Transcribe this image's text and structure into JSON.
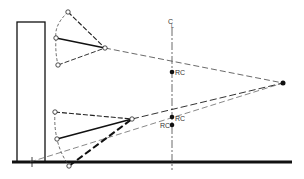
{
  "diagram": {
    "type": "geometric line diagram",
    "labels": {
      "centerline": "C",
      "centerline_sub": "L",
      "rc_upper": "RC",
      "rc_lower_right": "RC",
      "rc_lower_left": "RC"
    },
    "colors": {
      "line": "#111111",
      "dashed": "#444444",
      "background": "#ffffff"
    },
    "elements": {
      "wall_rect": {
        "x": 17,
        "y": 22,
        "w": 28,
        "h": 140
      },
      "ground_line": {
        "x1": 12,
        "y1": 162,
        "x2": 292,
        "y2": 162
      },
      "centerline_x": 172,
      "focal_point": {
        "x": 283,
        "y": 83
      },
      "upper_fan": {
        "apex": {
          "x": 105,
          "y": 48
        },
        "top": {
          "x": 68,
          "y": 12
        },
        "middle": {
          "x": 56,
          "y": 38
        },
        "bottom": {
          "x": 58,
          "y": 65
        }
      },
      "lower_fan": {
        "apex": {
          "x": 132,
          "y": 119
        },
        "top": {
          "x": 55,
          "y": 112
        },
        "middle": {
          "x": 57,
          "y": 139
        },
        "bottom": {
          "x": 69,
          "y": 166
        }
      },
      "rc_points": [
        {
          "x": 172,
          "y": 72
        },
        {
          "x": 172,
          "y": 117
        },
        {
          "x": 172,
          "y": 125
        }
      ]
    }
  }
}
